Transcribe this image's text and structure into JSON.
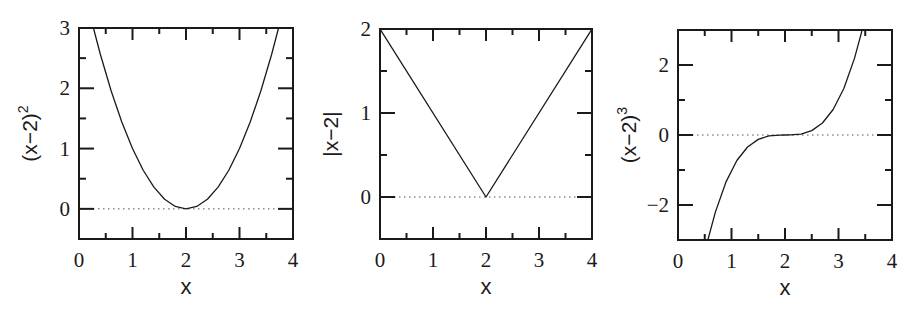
{
  "figure": {
    "panel_count": 3,
    "colors": {
      "axis": "#1a1a1a",
      "curve": "#1a1a1a",
      "zero_line": "#555555",
      "background": "#ffffff"
    }
  },
  "chart_data": [
    {
      "type": "line",
      "title": "",
      "function": "(x-2)^2",
      "xlabel": "x",
      "ylabel": "(x−2)",
      "ylabel_superscript": "2",
      "xlim": [
        0,
        4
      ],
      "ylim": [
        -0.5,
        3
      ],
      "xticks": [
        0,
        1,
        2,
        3,
        4
      ],
      "xtick_labels": [
        "0",
        "1",
        "2",
        "3",
        "4"
      ],
      "xminor": [
        0.5,
        1.5,
        2.5,
        3.5
      ],
      "yticks": [
        0,
        1,
        2,
        3
      ],
      "ytick_labels": [
        "0",
        "1",
        "2",
        "3"
      ],
      "yminor": [
        0.5,
        1.5,
        2.5
      ],
      "zero_line": "dotted",
      "grid": false,
      "frame_px": {
        "left": 79,
        "top": 28,
        "right": 293,
        "bottom": 239
      },
      "series": [
        {
          "name": "(x-2)^2",
          "x": [
            0.27,
            0.4,
            0.6,
            0.8,
            1.0,
            1.2,
            1.4,
            1.6,
            1.8,
            2.0,
            2.2,
            2.4,
            2.6,
            2.8,
            3.0,
            3.2,
            3.4,
            3.6,
            3.73
          ],
          "y": [
            3.0,
            2.56,
            1.96,
            1.44,
            1.0,
            0.64,
            0.36,
            0.16,
            0.04,
            0.0,
            0.04,
            0.16,
            0.36,
            0.64,
            1.0,
            1.44,
            1.96,
            2.56,
            3.0
          ]
        }
      ]
    },
    {
      "type": "line",
      "title": "",
      "function": "|x-2|",
      "xlabel": "x",
      "ylabel": "|x−2|",
      "ylabel_superscript": "",
      "xlim": [
        0,
        4
      ],
      "ylim": [
        -0.5,
        2
      ],
      "xticks": [
        0,
        1,
        2,
        3,
        4
      ],
      "xtick_labels": [
        "0",
        "1",
        "2",
        "3",
        "4"
      ],
      "xminor": [
        0.5,
        1.5,
        2.5,
        3.5
      ],
      "yticks": [
        0,
        1,
        2
      ],
      "ytick_labels": [
        "0",
        "1",
        "2"
      ],
      "yminor": [
        0.5,
        1.5
      ],
      "zero_line": "dotted",
      "grid": false,
      "frame_px": {
        "left": 380,
        "top": 29,
        "right": 592,
        "bottom": 239
      },
      "series": [
        {
          "name": "|x-2|",
          "x": [
            0,
            2,
            4
          ],
          "y": [
            2,
            0,
            2
          ]
        }
      ]
    },
    {
      "type": "line",
      "title": "",
      "function": "(x-2)^3",
      "xlabel": "x",
      "ylabel": "(x−2)",
      "ylabel_superscript": "3",
      "xlim": [
        0,
        4
      ],
      "ylim": [
        -3,
        3
      ],
      "xticks": [
        0,
        1,
        2,
        3,
        4
      ],
      "xtick_labels": [
        "0",
        "1",
        "2",
        "3",
        "4"
      ],
      "xminor": [
        0.5,
        1.5,
        2.5,
        3.5
      ],
      "yticks": [
        -2,
        0,
        2
      ],
      "ytick_labels": [
        "−2",
        "0",
        "2"
      ],
      "yminor": [
        -1,
        1
      ],
      "zero_line": "dotted",
      "grid": false,
      "frame_px": {
        "left": 678,
        "top": 30,
        "right": 892,
        "bottom": 240
      },
      "series": [
        {
          "name": "(x-2)^3",
          "x": [
            0.558,
            0.7,
            0.9,
            1.1,
            1.3,
            1.5,
            1.7,
            1.9,
            2.0,
            2.1,
            2.3,
            2.5,
            2.7,
            2.9,
            3.1,
            3.3,
            3.442
          ],
          "y": [
            -3.0,
            -2.197,
            -1.331,
            -0.729,
            -0.343,
            -0.125,
            -0.027,
            -0.001,
            0.0,
            0.001,
            0.027,
            0.125,
            0.343,
            0.729,
            1.331,
            2.197,
            3.0
          ]
        }
      ]
    }
  ]
}
